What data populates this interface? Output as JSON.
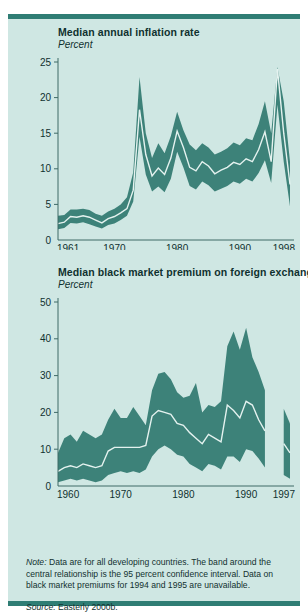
{
  "page": {
    "cut_off_top_text": "",
    "background_color": "#cfe7e3",
    "band_color": "#3d8279",
    "line_color": "#e4f2ef",
    "rule_color": "#2f7d74",
    "axis_color": "#3f6a67",
    "text_color": "#10312f"
  },
  "charts": [
    {
      "title": "Median annual inflation rate",
      "subtitle": "Percent",
      "y_ticks": [
        "25",
        "20",
        "15",
        "10",
        "5",
        "0"
      ],
      "x_ticks": [
        "1961",
        "1970",
        "1980",
        "1990",
        "1998"
      ]
    },
    {
      "title": "Median black market premium on foreign exchange",
      "subtitle": "Percent",
      "y_ticks": [
        "50",
        "40",
        "30",
        "20",
        "10",
        "0"
      ],
      "x_ticks": [
        "1960",
        "1970",
        "1980",
        "1990",
        "1997"
      ]
    }
  ],
  "note": {
    "label": "Note:",
    "line1": " Data are for all developing countries. The band around the",
    "line2": "central relationship is the 95 percent confidence interval. Data on",
    "line3": "black market premiums for 1994 and 1995 are unavailable."
  },
  "source": {
    "label": "Source:",
    "text": " Easterly 2000b."
  },
  "chart_data": [
    {
      "type": "area",
      "title": "Median annual inflation rate",
      "subtitle": "Percent",
      "xlabel": "",
      "ylabel": "Percent",
      "xlim": [
        1961,
        1998
      ],
      "ylim": [
        0,
        25
      ],
      "yticks": [
        0,
        5,
        10,
        15,
        20,
        25
      ],
      "xticks": [
        1961,
        1970,
        1980,
        1990,
        1998
      ],
      "grid": false,
      "legend": "none",
      "x": [
        1961,
        1962,
        1963,
        1964,
        1965,
        1966,
        1967,
        1968,
        1969,
        1970,
        1971,
        1972,
        1973,
        1974,
        1975,
        1976,
        1977,
        1978,
        1979,
        1980,
        1981,
        1982,
        1983,
        1984,
        1985,
        1986,
        1987,
        1988,
        1989,
        1990,
        1991,
        1992,
        1993,
        1994,
        1995,
        1996,
        1997,
        1998
      ],
      "series": [
        {
          "name": "median (central relationship)",
          "values": [
            2.3,
            2.5,
            3.3,
            3.2,
            3.4,
            3.2,
            2.8,
            2.4,
            3.0,
            3.3,
            3.8,
            4.4,
            7.0,
            18.3,
            12.0,
            9.0,
            10.1,
            9.2,
            11.5,
            15.3,
            13.0,
            10.2,
            9.7,
            11.0,
            10.4,
            9.3,
            9.8,
            10.2,
            10.9,
            10.6,
            11.4,
            11.0,
            12.7,
            15.2,
            11.0,
            24.0,
            15.0,
            7.8
          ]
        },
        {
          "name": "upper 95% confidence bound",
          "values": [
            3.4,
            3.5,
            4.3,
            4.3,
            4.4,
            4.2,
            3.7,
            3.4,
            4.0,
            4.4,
            5.0,
            6.0,
            9.5,
            22.9,
            15.0,
            11.5,
            13.6,
            12.2,
            14.6,
            18.0,
            15.4,
            13.4,
            12.6,
            13.6,
            13.0,
            12.0,
            12.4,
            12.9,
            13.7,
            13.3,
            14.3,
            14.0,
            16.3,
            19.5,
            15.0,
            24.3,
            19.5,
            11.0
          ]
        },
        {
          "name": "lower 95% confidence bound",
          "values": [
            1.5,
            1.7,
            2.4,
            2.3,
            2.5,
            2.2,
            1.9,
            1.6,
            2.1,
            2.3,
            2.8,
            3.4,
            5.4,
            14.5,
            9.2,
            6.8,
            7.5,
            6.7,
            8.6,
            12.4,
            10.2,
            7.6,
            7.1,
            8.2,
            7.7,
            6.8,
            7.2,
            7.6,
            8.2,
            7.9,
            8.6,
            8.2,
            9.4,
            11.2,
            8.0,
            19.0,
            11.0,
            4.7
          ]
        }
      ]
    },
    {
      "type": "area",
      "title": "Median black market premium on foreign exchange",
      "subtitle": "Percent",
      "xlabel": "",
      "ylabel": "Percent",
      "xlim": [
        1960,
        1997
      ],
      "ylim": [
        0,
        50
      ],
      "yticks": [
        0,
        10,
        20,
        30,
        40,
        50
      ],
      "xticks": [
        1960,
        1970,
        1980,
        1990,
        1997
      ],
      "grid": false,
      "legend": "none",
      "missing_years": [
        1994,
        1995
      ],
      "x": [
        1960,
        1961,
        1962,
        1963,
        1964,
        1965,
        1966,
        1967,
        1968,
        1969,
        1970,
        1971,
        1972,
        1973,
        1974,
        1975,
        1976,
        1977,
        1978,
        1979,
        1980,
        1981,
        1982,
        1983,
        1984,
        1985,
        1986,
        1987,
        1988,
        1989,
        1990,
        1991,
        1992,
        1993,
        1996,
        1997
      ],
      "series": [
        {
          "name": "median (central relationship)",
          "values": [
            4.0,
            5.0,
            5.5,
            5.0,
            6.0,
            5.5,
            5.0,
            5.5,
            9.5,
            10.5,
            10.5,
            10.5,
            10.5,
            10.5,
            11.0,
            19.0,
            20.5,
            20.0,
            19.5,
            17.0,
            16.5,
            14.5,
            13.0,
            11.5,
            14.0,
            13.0,
            12.0,
            22.0,
            20.5,
            18.5,
            23.0,
            22.0,
            18.0,
            15.0,
            11.5,
            9.0,
            8.0,
            6.5
          ]
        },
        {
          "name": "upper 95% confidence bound",
          "values": [
            9.0,
            13.0,
            14.0,
            12.0,
            15.0,
            14.0,
            13.0,
            14.0,
            18.0,
            21.0,
            18.5,
            18.5,
            21.5,
            19.0,
            16.5,
            26.0,
            30.5,
            31.0,
            29.0,
            25.5,
            24.0,
            24.5,
            28.0,
            20.0,
            22.0,
            21.5,
            23.0,
            38.0,
            42.0,
            37.0,
            43.0,
            35.0,
            31.0,
            26.0,
            21.0,
            17.0,
            15.0,
            13.5
          ]
        },
        {
          "name": "lower 95% confidence bound",
          "values": [
            1.0,
            1.5,
            2.0,
            1.5,
            2.0,
            1.5,
            1.0,
            1.5,
            3.0,
            3.5,
            4.0,
            3.5,
            4.0,
            3.5,
            4.5,
            8.0,
            10.0,
            11.0,
            10.0,
            8.5,
            8.0,
            6.0,
            5.0,
            4.0,
            6.0,
            5.5,
            4.5,
            8.0,
            8.0,
            6.5,
            10.0,
            9.5,
            7.5,
            5.0,
            3.0,
            2.0,
            3.0,
            2.5
          ]
        }
      ]
    }
  ]
}
